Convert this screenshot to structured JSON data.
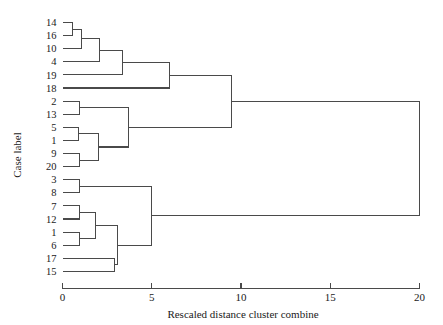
{
  "chart_data": {
    "type": "dendrogram",
    "title": "",
    "xlabel": "Rescaled distance cluster combine",
    "ylabel": "Case label",
    "xlim": [
      0,
      20
    ],
    "xticks": [
      0,
      5,
      10,
      15,
      20
    ],
    "xtick_labels": [
      "0",
      "5",
      "10",
      "15",
      "20"
    ],
    "grid": false,
    "legend": null,
    "leaf_labels": [
      "14",
      "16",
      "10",
      "4",
      "19",
      "18",
      "2",
      "13",
      "5",
      "1",
      "9",
      "20",
      "3",
      "8",
      "7",
      "12",
      "1",
      "6",
      "17",
      "15"
    ],
    "leaf_count": 20,
    "merges": [
      {
        "id": "m1",
        "left": "14",
        "right": "16",
        "distance": 0.55
      },
      {
        "id": "m2",
        "left": "m1",
        "right": "10",
        "distance": 1.05
      },
      {
        "id": "m3",
        "left": "m2",
        "right": "4",
        "distance": 2.05
      },
      {
        "id": "m4",
        "left": "m3",
        "right": "19",
        "distance": 3.35
      },
      {
        "id": "m5",
        "left": "m4",
        "right": "18",
        "distance": 6.0
      },
      {
        "id": "m6",
        "left": "2",
        "right": "13",
        "distance": 0.95
      },
      {
        "id": "m7",
        "left": "5",
        "right": "1",
        "distance": 0.9
      },
      {
        "id": "m8",
        "left": "9",
        "right": "20",
        "distance": 0.95
      },
      {
        "id": "m9",
        "left": "m7",
        "right": "m8",
        "distance": 2.0
      },
      {
        "id": "m10",
        "left": "m6",
        "right": "m9",
        "distance": 3.7
      },
      {
        "id": "m11",
        "left": "m5",
        "right": "m10",
        "distance": 9.45
      },
      {
        "id": "m12",
        "left": "3",
        "right": "8",
        "distance": 0.95
      },
      {
        "id": "m13",
        "left": "7",
        "right": "12",
        "distance": 0.95
      },
      {
        "id": "m14",
        "left": "1b",
        "right": "6",
        "distance": 0.95
      },
      {
        "id": "m15",
        "left": "m13",
        "right": "m14",
        "distance": 1.85
      },
      {
        "id": "m16",
        "left": "17",
        "right": "15",
        "distance": 2.9
      },
      {
        "id": "m17",
        "left": "m15",
        "right": "m16",
        "distance": 3.1
      },
      {
        "id": "m18",
        "left": "m12",
        "right": "m17",
        "distance": 5.0
      },
      {
        "id": "m19",
        "left": "m11",
        "right": "m18",
        "distance": 20.0
      }
    ]
  },
  "axis": {
    "x_title": "Rescaled distance cluster combine",
    "y_title": "Case label"
  }
}
